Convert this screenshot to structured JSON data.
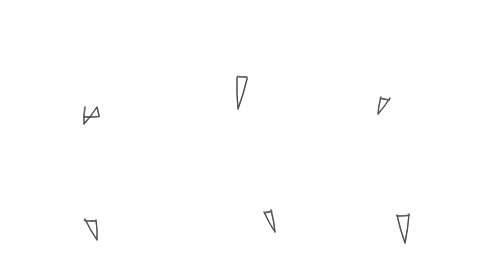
{
  "canvas": {
    "width": 486,
    "height": 259,
    "background": "#ffffff",
    "stroke_color": "#3a3a3a"
  },
  "bubbles": [
    {
      "id": 1,
      "label": "",
      "cx": 89,
      "cy": 77,
      "rx": 67,
      "ry": 40,
      "tail": {
        "left": [
          85,
          107
        ],
        "right": [
          97,
          107
        ],
        "tip": [
          84,
          124
        ]
      }
    },
    {
      "id": 2,
      "label": "",
      "cx": 249,
      "cy": 43,
      "rx": 67,
      "ry": 34,
      "tail": {
        "left": [
          237,
          78
        ],
        "right": [
          247,
          79
        ],
        "tip": [
          238,
          109
        ]
      }
    },
    {
      "id": 3,
      "label": "",
      "cx": 403,
      "cy": 64,
      "rx": 59,
      "ry": 37,
      "tail": {
        "left": [
          381,
          97
        ],
        "right": [
          390,
          98
        ],
        "tip": [
          378,
          114
        ]
      }
    },
    {
      "id": 4,
      "label": "",
      "cx": 94,
      "cy": 186,
      "rx": 67,
      "ry": 35,
      "tail": {
        "left": [
          85,
          219
        ],
        "right": [
          96,
          220
        ],
        "tip": [
          97,
          240
        ]
      }
    },
    {
      "id": 5,
      "label": "",
      "cx": 248,
      "cy": 176,
      "rx": 65,
      "ry": 38,
      "tail": {
        "left": [
          264,
          212
        ],
        "right": [
          271,
          210
        ],
        "tip": [
          275,
          232
        ]
      }
    },
    {
      "id": 6,
      "label": "",
      "cx": 396,
      "cy": 180,
      "rx": 67,
      "ry": 36,
      "tail": {
        "left": [
          397,
          215
        ],
        "right": [
          409,
          214
        ],
        "tip": [
          405,
          243
        ]
      }
    }
  ]
}
